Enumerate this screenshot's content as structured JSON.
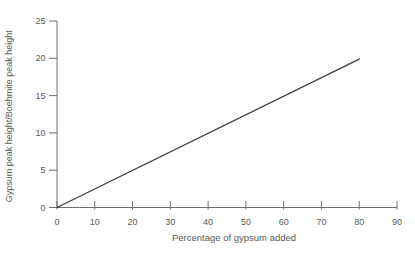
{
  "figure": {
    "background": "#ffffff"
  },
  "chart_data": {
    "type": "line",
    "title": "",
    "xlabel": "Percentage of gypsum added",
    "ylabel": "Gypsum peak height/Boehmite peak height",
    "xlim": [
      0,
      90
    ],
    "ylim": [
      0,
      25
    ],
    "xticks": [
      0,
      10,
      20,
      30,
      40,
      50,
      60,
      70,
      80,
      90
    ],
    "yticks": [
      0,
      5,
      10,
      15,
      20,
      25
    ],
    "grid": false,
    "legend": "none",
    "series": [
      {
        "name": "gypsum-to-boehmite-peak-ratio",
        "points": [
          [
            0,
            0
          ],
          [
            80,
            19.9
          ]
        ],
        "color": "#3f3f3f",
        "width": 1.3,
        "markers": false
      }
    ],
    "colors": {
      "axis": "#6e6e6e",
      "tick_text": "#5a5a5a",
      "label_text": "#5a5a5a"
    }
  }
}
